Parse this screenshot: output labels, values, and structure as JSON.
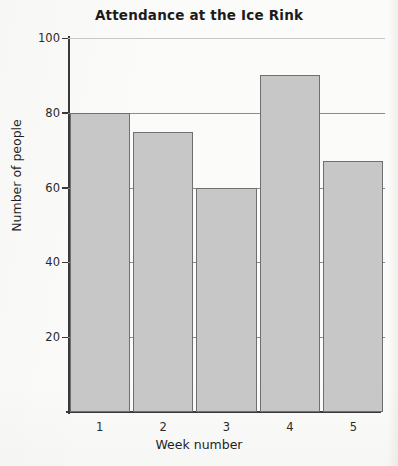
{
  "chart_data": {
    "type": "bar",
    "title": "Attendance at the Ice Rink",
    "xlabel": "Week number",
    "ylabel": "Number of people",
    "categories": [
      "1",
      "2",
      "3",
      "4",
      "5"
    ],
    "values": [
      80,
      75,
      60,
      90,
      67
    ],
    "ylim": [
      0,
      100
    ],
    "yticks": [
      0,
      20,
      40,
      60,
      80,
      100
    ],
    "ytick_labels": [
      "",
      "20",
      "40",
      "60",
      "80",
      "100"
    ],
    "grid": "horizontal",
    "legend": "none",
    "bar_color": "#c7c7c7",
    "bar_edge_color": "#6f6f6f",
    "axis_color": "#3a3a3a",
    "gridline_color": "#8c8c8c",
    "background_color": "#fbfbfa"
  }
}
